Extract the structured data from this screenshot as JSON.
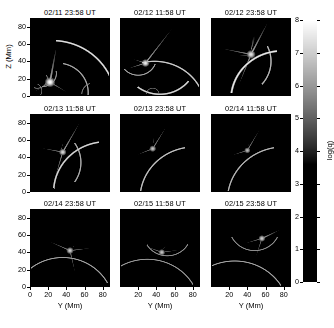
{
  "figure": {
    "type": "image-grid",
    "background": "#ffffff",
    "rows": 3,
    "cols": 3
  },
  "axes": {
    "x": {
      "title": "Y (Mm)",
      "ticks": [
        0,
        20,
        40,
        60,
        80
      ],
      "tick_labels": [
        "0",
        "20",
        "40",
        "60",
        "80"
      ],
      "range": [
        0,
        88
      ],
      "shown_on": "bottom-row"
    },
    "y": {
      "title": "Z (Mm)",
      "ticks": [
        0,
        20,
        40,
        60,
        80
      ],
      "tick_labels": [
        "0",
        "20",
        "40",
        "60",
        "80"
      ],
      "range": [
        0,
        90
      ],
      "shown_on": "left-column"
    }
  },
  "colorbar": {
    "title": "log(q)",
    "ticks": [
      0,
      1,
      2,
      3,
      4,
      5,
      6,
      7,
      8
    ],
    "tick_labels": [
      "0",
      "1",
      "2",
      "3",
      "4",
      "5",
      "6",
      "7",
      "8"
    ],
    "range": [
      0,
      8
    ],
    "orientation": "vertical",
    "colormap": "grayscale",
    "low_color": "#000000",
    "high_color": "#ffffff",
    "black_point": 3.6
  },
  "panels": [
    {
      "title": "02/11 23:58 UT",
      "row": 0,
      "col": 0,
      "chart_data": {
        "type": "heatmap",
        "title": "02/11 23:58 UT",
        "xlabel": "Y (Mm)",
        "ylabel": "Z (Mm)",
        "xlim": [
          0,
          88
        ],
        "ylim": [
          0,
          90
        ],
        "zlabel": "log(q)",
        "zlim": [
          0,
          8
        ],
        "background_level": 0.4,
        "features": [
          {
            "kind": "arc",
            "cx": 24,
            "cy": -6,
            "r": 70,
            "a0": 10,
            "a1": 86,
            "w": 1.1,
            "peak": 7.4
          },
          {
            "kind": "arc",
            "cx": 30,
            "cy": 4,
            "r": 34,
            "a0": -10,
            "a1": 80,
            "w": 1.0,
            "peak": 6.3
          },
          {
            "kind": "arc",
            "cx": 14,
            "cy": 26,
            "r": 15,
            "a0": -95,
            "a1": 10,
            "w": 0.9,
            "peak": 6.0
          },
          {
            "kind": "arc",
            "cx": 8,
            "cy": 20,
            "r": 11,
            "a0": -110,
            "a1": 20,
            "w": 0.8,
            "peak": 5.6
          },
          {
            "kind": "ray",
            "x0": 22,
            "y0": 16,
            "x1": 2,
            "y1": 3,
            "w": 1.0,
            "peak": 6.2
          },
          {
            "kind": "ray",
            "x0": 22,
            "y0": 16,
            "x1": 46,
            "y1": 1,
            "w": 1.0,
            "peak": 5.8
          },
          {
            "kind": "ray",
            "x0": 22,
            "y0": 16,
            "x1": 30,
            "y1": 62,
            "w": 1.3,
            "peak": 6.6
          },
          {
            "kind": "blob",
            "x": 22,
            "y": 16,
            "r": 4.5,
            "peak": 8.0
          },
          {
            "kind": "arc",
            "cx": 70,
            "cy": 2,
            "r": 13,
            "a0": 110,
            "a1": 180,
            "w": 0.9,
            "peak": 5.4
          },
          {
            "kind": "arc",
            "cx": 4,
            "cy": 6,
            "r": 9,
            "a0": -40,
            "a1": 60,
            "w": 0.8,
            "peak": 5.2
          }
        ]
      }
    },
    {
      "title": "02/12 11:58 UT",
      "row": 0,
      "col": 1,
      "chart_data": {
        "type": "heatmap",
        "title": "02/12 11:58 UT",
        "xlabel": "Y (Mm)",
        "ylabel": "Z (Mm)",
        "xlim": [
          0,
          88
        ],
        "ylim": [
          0,
          90
        ],
        "zlabel": "log(q)",
        "zlim": [
          0,
          8
        ],
        "background_level": 0.4,
        "features": [
          {
            "kind": "arc",
            "cx": 38,
            "cy": -16,
            "r": 56,
            "a0": 18,
            "a1": 104,
            "w": 1.0,
            "peak": 7.0
          },
          {
            "kind": "arc",
            "cx": 44,
            "cy": 42,
            "r": 40,
            "a0": -128,
            "a1": -38,
            "w": 1.1,
            "peak": 7.2
          },
          {
            "kind": "arc",
            "cx": 20,
            "cy": 44,
            "r": 20,
            "a0": -140,
            "a1": -20,
            "w": 0.9,
            "peak": 6.2
          },
          {
            "kind": "ray",
            "x0": 28,
            "y0": 38,
            "x1": 4,
            "y1": 30,
            "w": 0.9,
            "peak": 6.0
          },
          {
            "kind": "ray",
            "x0": 28,
            "y0": 38,
            "x1": 10,
            "y1": 44,
            "w": 0.8,
            "peak": 5.7
          },
          {
            "kind": "ray",
            "x0": 28,
            "y0": 38,
            "x1": 62,
            "y1": 84,
            "w": 1.0,
            "peak": 6.4
          },
          {
            "kind": "blob",
            "x": 28,
            "y": 38,
            "r": 3.6,
            "peak": 7.6
          },
          {
            "kind": "arc",
            "cx": 36,
            "cy": 2,
            "r": 7,
            "a0": 0,
            "a1": 180,
            "w": 0.8,
            "peak": 5.0
          }
        ]
      }
    },
    {
      "title": "02/12 23:58 UT",
      "row": 0,
      "col": 2,
      "chart_data": {
        "type": "heatmap",
        "title": "02/12 23:58 UT",
        "xlabel": "Y (Mm)",
        "ylabel": "Z (Mm)",
        "xlim": [
          0,
          88
        ],
        "ylim": [
          0,
          90
        ],
        "zlabel": "log(q)",
        "zlim": [
          0,
          8
        ],
        "background_level": 0.6,
        "features": [
          {
            "kind": "arc",
            "cx": 78,
            "cy": -4,
            "r": 56,
            "a0": 96,
            "a1": 172,
            "w": 1.2,
            "peak": 7.6
          },
          {
            "kind": "arc",
            "cx": 26,
            "cy": 40,
            "r": 40,
            "a0": -42,
            "a1": 26,
            "w": 1.0,
            "peak": 6.6
          },
          {
            "kind": "fan",
            "x": 44,
            "y": 52,
            "a0": 40,
            "a1": 116,
            "r": 40,
            "peak": 6.2,
            "w": 9
          },
          {
            "kind": "fan",
            "x": 44,
            "y": 46,
            "a0": 150,
            "a1": 200,
            "r": 34,
            "peak": 5.6,
            "w": 9
          },
          {
            "kind": "ray",
            "x0": 44,
            "y0": 48,
            "x1": 6,
            "y1": 56,
            "w": 1.0,
            "peak": 6.0
          },
          {
            "kind": "ray",
            "x0": 44,
            "y0": 48,
            "x1": 64,
            "y1": 88,
            "w": 1.1,
            "peak": 6.6
          },
          {
            "kind": "ray",
            "x0": 44,
            "y0": 48,
            "x1": 28,
            "y1": 6,
            "w": 1.0,
            "peak": 6.1
          },
          {
            "kind": "blob",
            "x": 44,
            "y": 48,
            "r": 4.0,
            "peak": 7.4
          }
        ]
      }
    },
    {
      "title": "02/13 11:58 UT",
      "row": 1,
      "col": 0,
      "chart_data": {
        "type": "heatmap",
        "title": "02/13 11:58 UT",
        "xlabel": "Y (Mm)",
        "ylabel": "Z (Mm)",
        "xlim": [
          0,
          88
        ],
        "ylim": [
          0,
          90
        ],
        "zlabel": "log(q)",
        "zlim": [
          0,
          8
        ],
        "background_level": 0.4,
        "features": [
          {
            "kind": "arc",
            "cx": 84,
            "cy": 0,
            "r": 58,
            "a0": 98,
            "a1": 176,
            "w": 1.1,
            "peak": 7.2
          },
          {
            "kind": "arc",
            "cx": 16,
            "cy": 34,
            "r": 40,
            "a0": -34,
            "a1": 34,
            "w": 1.0,
            "peak": 6.4
          },
          {
            "kind": "ray",
            "x0": 36,
            "y0": 46,
            "x1": 6,
            "y1": 52,
            "w": 0.9,
            "peak": 5.8
          },
          {
            "kind": "ray",
            "x0": 36,
            "y0": 46,
            "x1": 58,
            "y1": 86,
            "w": 1.0,
            "peak": 6.4
          },
          {
            "kind": "ray",
            "x0": 36,
            "y0": 46,
            "x1": 24,
            "y1": 4,
            "w": 0.9,
            "peak": 5.9
          },
          {
            "kind": "fan",
            "x": 34,
            "y": 48,
            "a0": 44,
            "a1": 104,
            "r": 30,
            "peak": 5.4,
            "w": 8
          },
          {
            "kind": "blob",
            "x": 36,
            "y": 46,
            "r": 3.4,
            "peak": 7.2
          }
        ]
      }
    },
    {
      "title": "02/13 23:58 UT",
      "row": 1,
      "col": 1,
      "chart_data": {
        "type": "heatmap",
        "title": "02/13 23:58 UT",
        "xlabel": "Y (Mm)",
        "ylabel": "Z (Mm)",
        "xlim": [
          0,
          88
        ],
        "ylim": [
          0,
          90
        ],
        "zlabel": "log(q)",
        "zlim": [
          0,
          8
        ],
        "background_level": 0.35,
        "features": [
          {
            "kind": "arc",
            "cx": 82,
            "cy": -8,
            "r": 60,
            "a0": 100,
            "a1": 174,
            "w": 1.0,
            "peak": 6.8
          },
          {
            "kind": "fan",
            "x": 36,
            "y": 52,
            "a0": 50,
            "a1": 118,
            "r": 30,
            "peak": 5.6,
            "w": 8
          },
          {
            "kind": "ray",
            "x0": 36,
            "y0": 50,
            "x1": 12,
            "y1": 40,
            "w": 0.9,
            "peak": 5.6
          },
          {
            "kind": "ray",
            "x0": 36,
            "y0": 50,
            "x1": 56,
            "y1": 84,
            "w": 0.9,
            "peak": 5.8
          },
          {
            "kind": "blob",
            "x": 36,
            "y": 50,
            "r": 3.2,
            "peak": 6.8
          }
        ]
      }
    },
    {
      "title": "02/14 11:58 UT",
      "row": 1,
      "col": 2,
      "chart_data": {
        "type": "heatmap",
        "title": "02/14 11:58 UT",
        "xlabel": "Y (Mm)",
        "ylabel": "Z (Mm)",
        "xlim": [
          0,
          88
        ],
        "ylim": [
          0,
          90
        ],
        "zlabel": "log(q)",
        "zlim": [
          0,
          8
        ],
        "background_level": 0.35,
        "features": [
          {
            "kind": "arc",
            "cx": 80,
            "cy": -10,
            "r": 62,
            "a0": 100,
            "a1": 172,
            "w": 1.0,
            "peak": 6.6
          },
          {
            "kind": "ray",
            "x0": 40,
            "y0": 48,
            "x1": 16,
            "y1": 40,
            "w": 0.9,
            "peak": 5.5
          },
          {
            "kind": "ray",
            "x0": 40,
            "y0": 48,
            "x1": 58,
            "y1": 80,
            "w": 0.9,
            "peak": 5.7
          },
          {
            "kind": "fan",
            "x": 40,
            "y": 48,
            "a0": 48,
            "a1": 112,
            "r": 26,
            "peak": 5.2,
            "w": 8
          },
          {
            "kind": "blob",
            "x": 40,
            "y": 48,
            "r": 3.0,
            "peak": 6.6
          }
        ]
      }
    },
    {
      "title": "02/14 23:58 UT",
      "row": 2,
      "col": 0,
      "chart_data": {
        "type": "heatmap",
        "title": "02/14 23:58 UT",
        "xlabel": "Y (Mm)",
        "ylabel": "Z (Mm)",
        "xlim": [
          0,
          88
        ],
        "ylim": [
          0,
          90
        ],
        "zlabel": "log(q)",
        "zlim": [
          0,
          8
        ],
        "background_level": 0.3,
        "features": [
          {
            "kind": "arc",
            "cx": 36,
            "cy": -22,
            "r": 56,
            "a0": 28,
            "a1": 132,
            "w": 0.9,
            "peak": 6.2
          },
          {
            "kind": "ray",
            "x0": 44,
            "y0": 42,
            "x1": 14,
            "y1": 56,
            "w": 0.9,
            "peak": 5.8
          },
          {
            "kind": "ray",
            "x0": 44,
            "y0": 42,
            "x1": 76,
            "y1": 46,
            "w": 0.9,
            "peak": 5.6
          },
          {
            "kind": "ray",
            "x0": 44,
            "y0": 42,
            "x1": 52,
            "y1": 6,
            "w": 0.9,
            "peak": 5.6
          },
          {
            "kind": "fan",
            "x": 44,
            "y": 44,
            "a0": 10,
            "a1": 60,
            "r": 22,
            "peak": 5.4,
            "w": 7
          },
          {
            "kind": "blob",
            "x": 44,
            "y": 42,
            "r": 3.4,
            "peak": 7.0
          }
        ]
      }
    },
    {
      "title": "02/15 11:58 UT",
      "row": 2,
      "col": 1,
      "chart_data": {
        "type": "heatmap",
        "title": "02/15 11:58 UT",
        "xlabel": "Y (Mm)",
        "ylabel": "Z (Mm)",
        "xlim": [
          0,
          88
        ],
        "ylim": [
          0,
          90
        ],
        "zlabel": "log(q)",
        "zlim": [
          0,
          8
        ],
        "background_level": 0.3,
        "features": [
          {
            "kind": "arc",
            "cx": 30,
            "cy": -26,
            "r": 58,
            "a0": 30,
            "a1": 128,
            "w": 0.9,
            "peak": 6.0
          },
          {
            "kind": "arc",
            "cx": 52,
            "cy": 62,
            "r": 26,
            "a0": -150,
            "a1": -30,
            "w": 0.9,
            "peak": 5.8
          },
          {
            "kind": "ray",
            "x0": 46,
            "y0": 40,
            "x1": 20,
            "y1": 50,
            "w": 0.9,
            "peak": 5.6
          },
          {
            "kind": "ray",
            "x0": 46,
            "y0": 40,
            "x1": 74,
            "y1": 44,
            "w": 0.9,
            "peak": 5.4
          },
          {
            "kind": "fan",
            "x": 46,
            "y": 42,
            "a0": 20,
            "a1": 80,
            "r": 22,
            "peak": 5.2,
            "w": 7
          },
          {
            "kind": "blob",
            "x": 46,
            "y": 40,
            "r": 3.2,
            "peak": 6.8
          }
        ]
      }
    },
    {
      "title": "02/15 23:58 UT",
      "row": 2,
      "col": 2,
      "chart_data": {
        "type": "heatmap",
        "title": "02/15 23:58 UT",
        "xlabel": "Y (Mm)",
        "ylabel": "Z (Mm)",
        "xlim": [
          0,
          88
        ],
        "ylim": [
          0,
          90
        ],
        "zlabel": "log(q)",
        "zlim": [
          0,
          8
        ],
        "background_level": 0.3,
        "features": [
          {
            "kind": "arc",
            "cx": 26,
            "cy": -30,
            "r": 60,
            "a0": 32,
            "a1": 126,
            "w": 0.9,
            "peak": 6.2
          },
          {
            "kind": "arc",
            "cx": 48,
            "cy": 70,
            "r": 28,
            "a0": -154,
            "a1": -26,
            "w": 0.9,
            "peak": 5.8
          },
          {
            "kind": "ray",
            "x0": 56,
            "y0": 56,
            "x1": 30,
            "y1": 48,
            "w": 0.9,
            "peak": 5.6
          },
          {
            "kind": "ray",
            "x0": 56,
            "y0": 56,
            "x1": 80,
            "y1": 68,
            "w": 1.0,
            "peak": 6.2
          },
          {
            "kind": "ray",
            "x0": 56,
            "y0": 56,
            "x1": 46,
            "y1": 24,
            "w": 0.9,
            "peak": 5.4
          },
          {
            "kind": "fan",
            "x": 56,
            "y": 56,
            "a0": 8,
            "a1": 54,
            "r": 24,
            "peak": 5.4,
            "w": 7
          },
          {
            "kind": "blob",
            "x": 56,
            "y": 56,
            "r": 3.2,
            "peak": 7.0
          }
        ]
      }
    }
  ]
}
